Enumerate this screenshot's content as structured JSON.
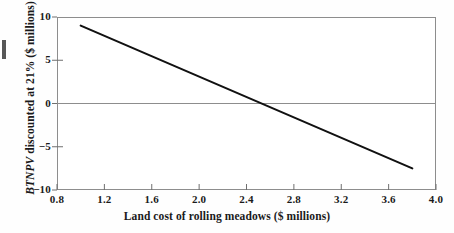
{
  "chart_data": {
    "type": "line",
    "title": "",
    "xlabel": "Land cost of rolling meadows ($ millions)",
    "ylabel_italic_part": "BTNPV",
    "ylabel_rest": " discounted at 21% ($ millions)",
    "ylabel": "BTNPV discounted at 21% ($ millions)",
    "xlim": [
      0.8,
      4.0
    ],
    "ylim": [
      -10,
      10
    ],
    "xticks": [
      0.8,
      1.2,
      1.6,
      2.0,
      2.4,
      2.8,
      3.2,
      3.6,
      4.0
    ],
    "xtick_labels": [
      "0.8",
      "1.2",
      "1.6",
      "2.0",
      "2.4",
      "2.8",
      "3.2",
      "3.6",
      "4.0"
    ],
    "yticks": [
      10,
      5,
      0,
      -5,
      -10
    ],
    "ytick_labels": [
      "10",
      "5",
      "0",
      "−5",
      "−10"
    ],
    "grid": false,
    "legend": null,
    "zero_line": {
      "value": 0,
      "color": "#8d8d8d",
      "orientation": "horizontal"
    },
    "series": [
      {
        "name": "BTNPV vs land cost",
        "color": "#111111",
        "x": [
          1.0,
          3.8
        ],
        "values": [
          9.0,
          -7.5
        ],
        "breakeven_x": 2.53,
        "slope": -5.89
      }
    ]
  },
  "figure": {
    "frame_color": "#8d8d8d",
    "background": "#fefefe",
    "line_color": "#111111"
  }
}
